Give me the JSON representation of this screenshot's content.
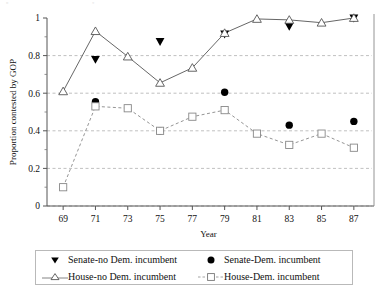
{
  "chart_data": {
    "type": "line",
    "title": "",
    "xlabel": "Year",
    "ylabel": "Proportion contested by GOP",
    "x": [
      69,
      71,
      73,
      75,
      77,
      79,
      81,
      83,
      85,
      87
    ],
    "xtick_labels": [
      "69",
      "71",
      "73",
      "75",
      "77",
      "79",
      "81",
      "83",
      "85",
      "87"
    ],
    "ytick_labels": [
      "0",
      "0.2",
      "0.4",
      "0.6",
      "0.8",
      "1"
    ],
    "ytick_values": [
      0,
      0.2,
      0.4,
      0.6,
      0.8,
      1
    ],
    "xlim": [
      68,
      88
    ],
    "ylim": [
      0,
      1
    ],
    "grid": true,
    "grid_style": "dashed-horizontal",
    "legend_position": "bottom",
    "series": [
      {
        "name": "Senate-no Dem. incumbent",
        "marker": "filled-triangle-down",
        "line": "none",
        "color": "#000000",
        "x": [
          71,
          75,
          79,
          83,
          87
        ],
        "values": [
          0.78,
          0.875,
          0.915,
          0.955,
          1.0
        ]
      },
      {
        "name": "Senate-Dem. incumbent",
        "marker": "filled-circle",
        "line": "none",
        "color": "#000000",
        "x": [
          71,
          75,
          79,
          83,
          87
        ],
        "values": [
          0.555,
          0.4,
          0.605,
          0.43,
          0.45
        ]
      },
      {
        "name": "House-no Dem. incumbent",
        "marker": "open-triangle-up",
        "line": "solid",
        "color": "#555555",
        "x": [
          69,
          71,
          73,
          75,
          77,
          79,
          81,
          83,
          85,
          87
        ],
        "values": [
          0.61,
          0.93,
          0.795,
          0.655,
          0.735,
          0.92,
          0.995,
          0.99,
          0.975,
          1.0
        ]
      },
      {
        "name": "House-Dem. incumbent",
        "marker": "open-square",
        "line": "dashed",
        "color": "#888888",
        "x": [
          69,
          71,
          73,
          75,
          77,
          79,
          81,
          83,
          85,
          87
        ],
        "values": [
          0.1,
          0.53,
          0.52,
          0.4,
          0.475,
          0.51,
          0.385,
          0.325,
          0.385,
          0.31
        ]
      }
    ]
  },
  "legend": {
    "entries": [
      {
        "label": "Senate-no Dem. incumbent",
        "marker": "filled-triangle-down-icon"
      },
      {
        "label": "Senate-Dem. incumbent",
        "marker": "filled-circle-icon"
      },
      {
        "label": "House-no Dem. incumbent",
        "marker": "open-triangle-up-icon"
      },
      {
        "label": "House-Dem. incumbent",
        "marker": "open-square-icon"
      }
    ]
  }
}
